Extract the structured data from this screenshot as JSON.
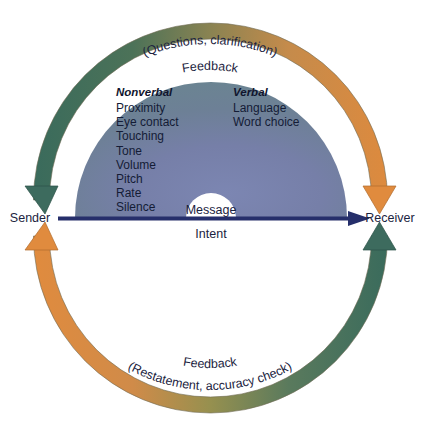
{
  "diagram": {
    "endpoints": {
      "sender": "Sender",
      "receiver": "Receiver"
    },
    "center_arrow": {
      "above_label": "Message",
      "below_label": "Intent",
      "color": "#262f6b",
      "direction": "sender-to-receiver"
    },
    "top_arc": {
      "outer_label": "(Questions, clarification)",
      "inner_label": "Feedback",
      "start_color": "#3d6b5e",
      "end_color": "#d98840",
      "direction": "receiver-to-sender"
    },
    "bottom_arc": {
      "inner_label": "Feedback",
      "outer_label": "(Restatement, accuracy check)",
      "start_color": "#d98840",
      "end_color": "#3d6b5e",
      "direction": "receiver-to-sender"
    },
    "semicircle": {
      "edge_color": "#6e8692",
      "center_color": "#7480ab",
      "columns": [
        {
          "heading": "Nonverbal",
          "items": [
            "Proximity",
            "Eye contact",
            "Touching",
            "Tone",
            "Volume",
            "Pitch",
            "Rate",
            "Silence"
          ]
        },
        {
          "heading": "Verbal",
          "items": [
            "Language",
            "Word choice"
          ]
        }
      ]
    }
  }
}
